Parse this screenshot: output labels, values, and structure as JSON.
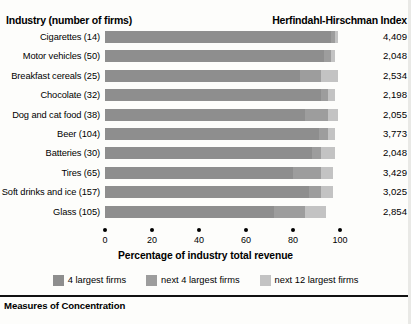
{
  "header": {
    "left_title": "Industry (number of firms)",
    "right_title": "Herfindahl-Hirschman Index"
  },
  "footer": {
    "section_title": "Measures of Concentration"
  },
  "legend": {
    "items": [
      {
        "label": "4 largest firms",
        "color": "#8e8e8e",
        "name": "legend-4-largest"
      },
      {
        "label": "next 4 largest firms",
        "color": "#9d9d9d",
        "name": "legend-next-4"
      },
      {
        "label": "next 12 largest firms",
        "color": "#c3c3c3",
        "name": "legend-next-12"
      }
    ]
  },
  "chart_data": {
    "type": "bar",
    "orientation": "horizontal",
    "stacked": true,
    "title": "",
    "xlabel": "Percentage of industry total revenue",
    "ylabel": "Industry (number of firms)",
    "xlim": [
      0,
      100
    ],
    "xticks": [
      0,
      20,
      40,
      60,
      80,
      100
    ],
    "xticklabels": [
      "0",
      "20",
      "40",
      "60",
      "80",
      "100"
    ],
    "grid": false,
    "legend_position": "bottom",
    "categories": [
      "Cigarettes (14)",
      "Motor vehicles (50)",
      "Breakfast cereals (25)",
      "Chocolate (32)",
      "Dog and cat food (38)",
      "Beer (104)",
      "Batteries (30)",
      "Tires (65)",
      "Soft drinks and ice (157)",
      "Glass (105)"
    ],
    "series": [
      {
        "name": "4 largest firms",
        "values": [
          96,
          93,
          83,
          92,
          85,
          91,
          88,
          80,
          87,
          72
        ]
      },
      {
        "name": "next 4 largest firms",
        "values": [
          2,
          3,
          9,
          3,
          10,
          4,
          4,
          12,
          5,
          13
        ]
      },
      {
        "name": "next 12 largest firms",
        "values": [
          1,
          2,
          7,
          3,
          4,
          3,
          6,
          5,
          5,
          9
        ]
      }
    ],
    "value_column_header": "Herfindahl-Hirschman Index",
    "values_hhi": [
      "4,409",
      "2,048",
      "2,534",
      "2,198",
      "2,055",
      "3,773",
      "2,048",
      "3,429",
      "3,025",
      "2,854"
    ]
  }
}
